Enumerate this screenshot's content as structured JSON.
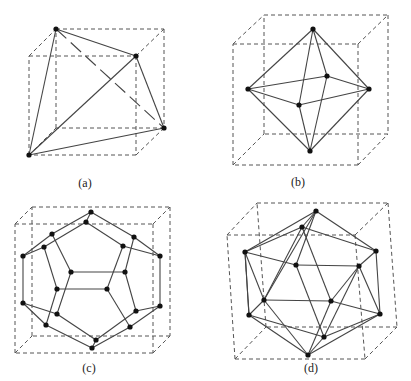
{
  "figures": [
    {
      "id": "a",
      "label": "(a)",
      "polyhedron": "tetrahedron inscribed in cube",
      "label_pos": [
        85,
        177
      ]
    },
    {
      "id": "b",
      "label": "(b)",
      "polyhedron": "octahedron inscribed in cube",
      "label_pos": [
        298,
        176
      ]
    },
    {
      "id": "c",
      "label": "(c)",
      "polyhedron": "dodecahedron inscribed in cube",
      "label_pos": [
        89,
        362
      ]
    },
    {
      "id": "d",
      "label": "(d)",
      "polyhedron": "icosahedron inscribed in cube",
      "label_pos": [
        311,
        362
      ]
    }
  ],
  "colors": {
    "edge": "#444444",
    "cube": "#555555",
    "vertex": "#111111",
    "background": "#ffffff"
  }
}
